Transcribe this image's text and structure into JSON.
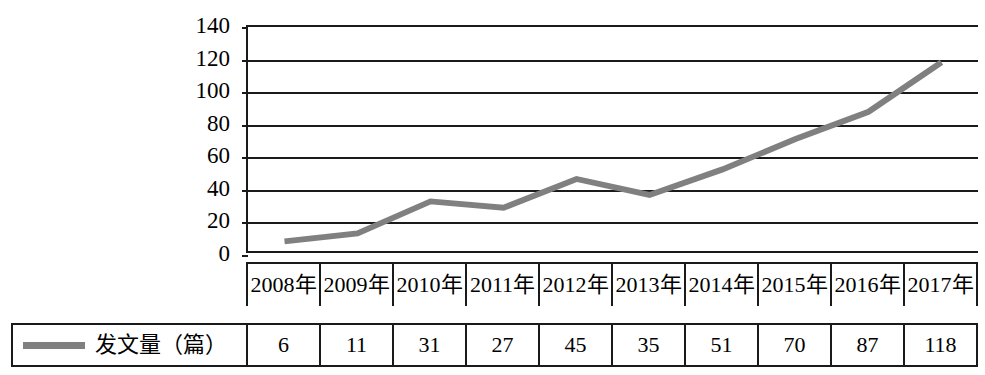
{
  "chart_data": {
    "type": "line",
    "title": "",
    "xlabel": "",
    "ylabel": "",
    "categories": [
      "2008年",
      "2009年",
      "2010年",
      "2011年",
      "2012年",
      "2013年",
      "2014年",
      "2015年",
      "2016年",
      "2017年"
    ],
    "values": [
      6,
      11,
      31,
      27,
      45,
      35,
      51,
      70,
      87,
      118
    ],
    "series": [
      {
        "name": "发文量（篇）",
        "values": [
          6,
          11,
          31,
          27,
          45,
          35,
          51,
          70,
          87,
          118
        ],
        "color": "#808080"
      }
    ],
    "ylim": [
      0,
      140
    ],
    "ytick_labels": [
      "140",
      "120",
      "100",
      "80",
      "60",
      "40",
      "20",
      "0"
    ],
    "ytick_values": [
      140,
      120,
      100,
      80,
      60,
      40,
      20,
      0
    ],
    "grid": true,
    "legend_position": "bottom-left",
    "line_color": "#808080",
    "axis_color": "#1a1a1a"
  },
  "legend": {
    "label": "发文量（篇）",
    "swatch_name": "line-swatch"
  }
}
